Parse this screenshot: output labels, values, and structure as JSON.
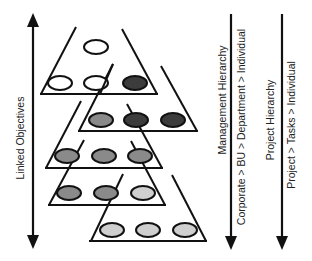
{
  "diagram": {
    "labels": {
      "left_axis": "Linked Objectives",
      "management_title": "Management Hierarchy",
      "management_path": "Corporate > BU > Department > Individual",
      "project_title": "Project Hierarchy",
      "project_path": "Project > Tasks > Individual"
    },
    "colors": {
      "stroke": "#111111",
      "empty": "#ffffff",
      "dark": "#3c3c3c",
      "medium": "#8a8a8a",
      "light": "#cfcfcf"
    },
    "arrows": [
      {
        "name": "linked-objectives-arrow",
        "direction": "both"
      },
      {
        "name": "management-hierarchy-arrow",
        "direction": "down"
      },
      {
        "name": "project-hierarchy-arrow",
        "direction": "down"
      }
    ],
    "tiers": [
      {
        "name": "tier-1",
        "nodes": [
          "empty",
          "empty",
          "empty",
          "dark"
        ]
      },
      {
        "name": "tier-2",
        "nodes": [
          "medium",
          "dark",
          "dark"
        ]
      },
      {
        "name": "tier-3",
        "nodes": [
          "medium",
          "medium",
          "medium"
        ]
      },
      {
        "name": "tier-4",
        "nodes": [
          "medium",
          "medium",
          "light"
        ]
      },
      {
        "name": "tier-5",
        "nodes": [
          "light",
          "light",
          "light"
        ]
      }
    ]
  }
}
